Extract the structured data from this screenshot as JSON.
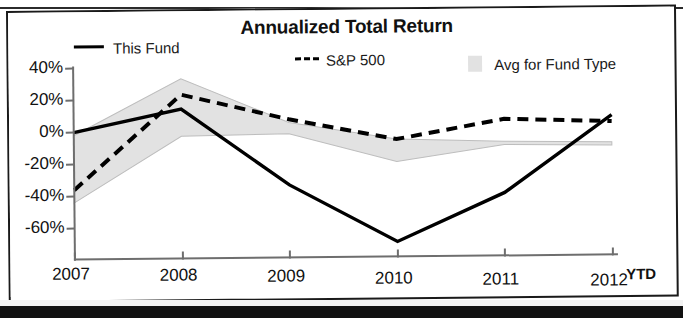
{
  "chart_data": {
    "type": "line",
    "title": "Annualized Total Return",
    "xlabel": "",
    "ylabel": "",
    "categories": [
      "2007",
      "2008",
      "2009",
      "2010",
      "2011",
      "2012"
    ],
    "x_axis_note": "YTD",
    "ylim": [
      -72,
      40
    ],
    "yticks": [
      40,
      20,
      0,
      -20,
      -40,
      -60
    ],
    "ytick_labels": [
      "40%",
      "20%",
      "0%",
      "-20%",
      "-40%",
      "-60%"
    ],
    "grid": false,
    "legend_position": "top",
    "series": [
      {
        "name": "This Fund",
        "style": "solid",
        "color": "#000000",
        "values": [
          0,
          14,
          -34,
          -70,
          -40,
          8
        ]
      },
      {
        "name": "S&P 500",
        "style": "dashed",
        "color": "#000000",
        "values": [
          -36,
          23,
          7,
          -6,
          6,
          4
        ]
      },
      {
        "name": "Avg for Fund Type",
        "style": "band",
        "color": "#e2e2e2",
        "band_upper": [
          -2,
          33,
          5,
          -6,
          -8,
          -9
        ],
        "band_lower": [
          -44,
          -3,
          -2,
          -20,
          -10,
          -11
        ]
      }
    ]
  },
  "chart": {
    "title": "Annualized Total Return",
    "legend": [
      {
        "label": "This Fund",
        "marker": "solid-line-swatch"
      },
      {
        "label": "S&P 500",
        "marker": "dashed-line-swatch"
      },
      {
        "label": "Avg for Fund Type",
        "marker": "gray-band-swatch"
      }
    ],
    "y_labels": [
      "40%",
      "20%",
      "0%",
      "-20%",
      "-40%",
      "-60%"
    ],
    "x_labels": [
      "2007",
      "2008",
      "2009",
      "2010",
      "2011",
      "2012"
    ],
    "ytd_label": "YTD"
  },
  "colors": {
    "line": "#000000",
    "band": "#e2e2e2",
    "axis": "#6e6e6e",
    "frame": "#1a1a1a"
  }
}
